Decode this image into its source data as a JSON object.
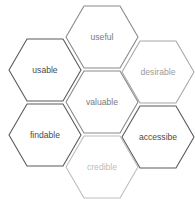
{
  "diagram": {
    "type": "honeycomb",
    "hex": {
      "half_width": 36,
      "half_height": 31,
      "stroke_width": 1.1
    },
    "cells": [
      {
        "id": "useful",
        "label": "useful",
        "cx": 102,
        "cy": 37,
        "stroke": "#8a8a8a",
        "text": "#7a7a7a"
      },
      {
        "id": "usable",
        "label": "usable",
        "cx": 45,
        "cy": 70,
        "stroke": "#5a5a5a",
        "text": "#4a4a4a"
      },
      {
        "id": "desirable",
        "label": "desirable",
        "cx": 158,
        "cy": 72,
        "stroke": "#a8a8a8",
        "text": "#9a9a9a"
      },
      {
        "id": "valuable",
        "label": "valuable",
        "cx": 102,
        "cy": 102,
        "stroke": "#8a8a8a",
        "text": "#7a7a7a"
      },
      {
        "id": "findable",
        "label": "findable",
        "cx": 45,
        "cy": 135,
        "stroke": "#5a5a5a",
        "text": "#4a4a4a"
      },
      {
        "id": "accessibe",
        "label": "accessibe",
        "cx": 158,
        "cy": 137,
        "stroke": "#5a5a5a",
        "text": "#4a4a4a"
      },
      {
        "id": "credible",
        "label": "credible",
        "cx": 102,
        "cy": 167,
        "stroke": "#bdbdbd",
        "text": "#bcbcbc"
      }
    ]
  }
}
